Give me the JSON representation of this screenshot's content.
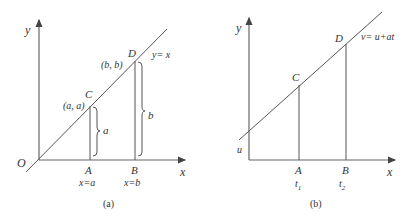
{
  "panel_a": {
    "caption": "(a)",
    "y_axis_label": "y",
    "x_axis_label": "x",
    "origin_label": "O",
    "line_label": "y= x",
    "point_c": {
      "label": "C",
      "coord": "(a, a)"
    },
    "point_d": {
      "label": "D",
      "coord": "(b, b)"
    },
    "point_a": {
      "label": "A",
      "sub": "x=a"
    },
    "point_b": {
      "label": "B",
      "sub": "x=b"
    },
    "brace_a_label": "a",
    "brace_b_label": "b"
  },
  "panel_b": {
    "caption": "(b)",
    "y_axis_label": "y",
    "x_axis_label": "x",
    "intercept_label": "u",
    "line_label": "v= u+at",
    "point_c": {
      "label": "C"
    },
    "point_d": {
      "label": "D"
    },
    "point_a": {
      "label": "A",
      "sub_main": "t",
      "sub_index": "1"
    },
    "point_b": {
      "label": "B",
      "sub_main": "t",
      "sub_index": "2"
    }
  }
}
